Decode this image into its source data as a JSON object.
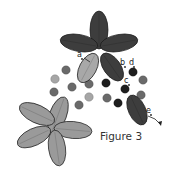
{
  "caption": "Figure 3",
  "colors": {
    "dark_petal": "#3d3d3d",
    "light_petal": "#9a9a9a",
    "mid_petal": "#a8a8a8",
    "dark_bead": "#1e1e1e",
    "mid_bead": "#6a6a6a",
    "light_bead": "#a6a6a6",
    "outline": "#1a1a1a",
    "thread": "#222222"
  },
  "labels": [
    {
      "text": "a",
      "x": 77,
      "y": 57
    },
    {
      "text": "b",
      "x": 120,
      "y": 65
    },
    {
      "text": "d",
      "x": 129,
      "y": 65
    },
    {
      "text": "c",
      "x": 124,
      "y": 83
    },
    {
      "text": "e",
      "x": 146,
      "y": 113
    }
  ],
  "dark_flower": {
    "center": [
      99,
      52
    ],
    "petals": [
      {
        "cx": 99,
        "cy": 30,
        "rx": 9,
        "ry": 19,
        "rot": 0
      },
      {
        "cx": 79,
        "cy": 43,
        "rx": 19,
        "ry": 8.5,
        "rot": 10
      },
      {
        "cx": 119,
        "cy": 43,
        "rx": 19,
        "ry": 8.5,
        "rot": -10
      }
    ]
  },
  "diagonal_petals": [
    {
      "cx": 88,
      "cy": 68,
      "rx": 8.5,
      "ry": 16,
      "rot": 28,
      "tone": "mid"
    },
    {
      "cx": 112,
      "cy": 67,
      "rx": 8.5,
      "ry": 16,
      "rot": -35,
      "tone": "dark"
    },
    {
      "cx": 137,
      "cy": 110,
      "rx": 8.5,
      "ry": 16,
      "rot": -25,
      "tone": "dark"
    }
  ],
  "light_flower": {
    "petals": [
      {
        "cx": 58,
        "cy": 115,
        "rx": 8.5,
        "ry": 19,
        "rot": 20
      },
      {
        "cx": 37,
        "cy": 114,
        "rx": 19,
        "ry": 9,
        "rot": 25
      },
      {
        "cx": 73,
        "cy": 130,
        "rx": 19,
        "ry": 8.5,
        "rot": 5
      },
      {
        "cx": 34,
        "cy": 137,
        "rx": 18,
        "ry": 8.5,
        "rot": -25
      },
      {
        "cx": 57,
        "cy": 148,
        "rx": 8.5,
        "ry": 18,
        "rot": -8
      }
    ]
  },
  "beads": [
    {
      "cx": 66,
      "cy": 70,
      "r": 4.3,
      "tone": "mid"
    },
    {
      "cx": 55,
      "cy": 79,
      "r": 4.3,
      "tone": "light"
    },
    {
      "cx": 54,
      "cy": 92,
      "r": 4.3,
      "tone": "mid"
    },
    {
      "cx": 72,
      "cy": 87,
      "r": 4.3,
      "tone": "mid"
    },
    {
      "cx": 89,
      "cy": 84,
      "r": 4.3,
      "tone": "mid"
    },
    {
      "cx": 89,
      "cy": 97,
      "r": 4.3,
      "tone": "light"
    },
    {
      "cx": 79,
      "cy": 105,
      "r": 4.3,
      "tone": "mid"
    },
    {
      "cx": 106,
      "cy": 83,
      "r": 4.3,
      "tone": "dark"
    },
    {
      "cx": 107,
      "cy": 98,
      "r": 4.3,
      "tone": "mid"
    },
    {
      "cx": 118,
      "cy": 103,
      "r": 4.3,
      "tone": "dark"
    },
    {
      "cx": 125,
      "cy": 89,
      "r": 4.3,
      "tone": "dark"
    },
    {
      "cx": 133,
      "cy": 72,
      "r": 4.3,
      "tone": "dark"
    },
    {
      "cx": 143,
      "cy": 80,
      "r": 4.3,
      "tone": "mid"
    },
    {
      "cx": 141,
      "cy": 95,
      "r": 4.3,
      "tone": "mid"
    }
  ]
}
